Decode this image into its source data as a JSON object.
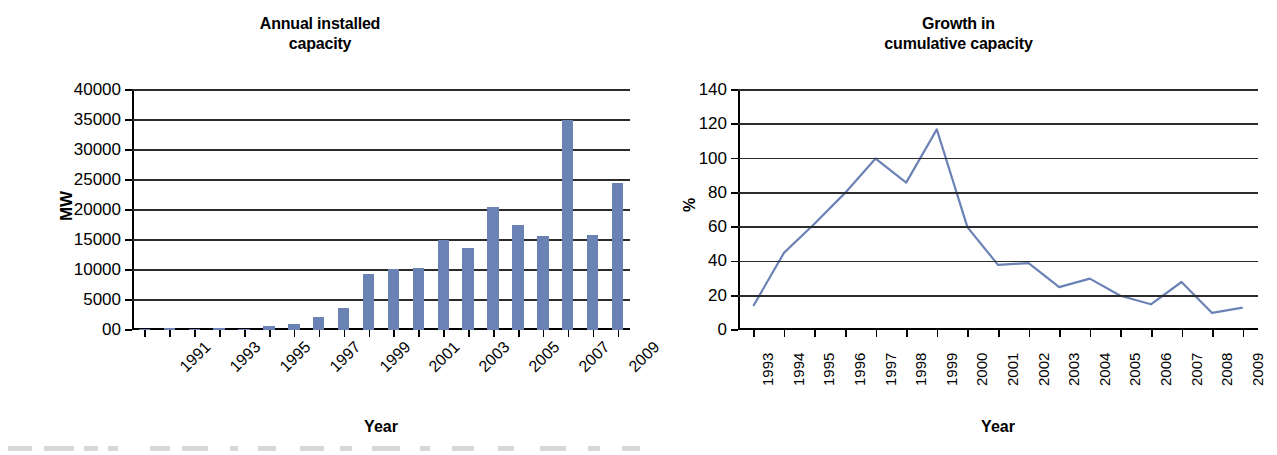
{
  "figure": {
    "background": "#ffffff",
    "series_color": "#6b82b5",
    "axis_color": "#000000"
  },
  "charts": [
    {
      "id": "annual-installed-capacity",
      "title_line1": "Annual installed",
      "title_line2": "capacity",
      "xlabel": "Year",
      "ylabel": "MW"
    },
    {
      "id": "growth-in-cumulative-capacity",
      "title_line1": "Growth in",
      "title_line2": "cumulative capacity",
      "xlabel": "Year",
      "ylabel": "%"
    }
  ],
  "chart_data": [
    {
      "type": "bar",
      "title": "Annual installed capacity",
      "xlabel": "Year",
      "ylabel": "MW",
      "ylim": [
        0,
        40000
      ],
      "ytick_labels": [
        "40000",
        "35000",
        "30000",
        "25000",
        "20000",
        "15000",
        "10000",
        "5000",
        "00"
      ],
      "ytick_values": [
        40000,
        35000,
        30000,
        25000,
        20000,
        15000,
        10000,
        5000,
        0
      ],
      "grid": true,
      "legend": "none",
      "categories": [
        1991,
        1992,
        1993,
        1994,
        1995,
        1996,
        1997,
        1998,
        1999,
        2000,
        2001,
        2002,
        2003,
        2004,
        2005,
        2006,
        2007,
        2008,
        2009
      ],
      "xtick_labels_shown": [
        "1991",
        "1993",
        "1995",
        "1997",
        "1999",
        "2001",
        "2003",
        "2005",
        "2007",
        "2009"
      ],
      "values": [
        200,
        300,
        150,
        350,
        250,
        600,
        1000,
        2250,
        3700,
        9400,
        10100,
        10350,
        15000,
        13700,
        20500,
        17500,
        15600,
        35000,
        15800,
        24500
      ]
    },
    {
      "type": "line",
      "title": "Growth in cumulative capacity",
      "xlabel": "Year",
      "ylabel": "%",
      "ylim": [
        0,
        140
      ],
      "ytick_labels": [
        "0",
        "20",
        "40",
        "60",
        "80",
        "100",
        "120",
        "140"
      ],
      "ytick_values": [
        0,
        20,
        40,
        60,
        80,
        100,
        120,
        140
      ],
      "grid": true,
      "legend": "none",
      "x": [
        1993,
        1994,
        1995,
        1996,
        1997,
        1998,
        1999,
        2000,
        2001,
        2002,
        2003,
        2004,
        2005,
        2006,
        2007,
        2008,
        2009
      ],
      "xtick_labels": [
        "1993",
        "1994",
        "1995",
        "1996",
        "1997",
        "1998",
        "1999",
        "2000",
        "2001",
        "2002",
        "2003",
        "2004",
        "2005",
        "2006",
        "2007",
        "2008",
        "2009"
      ],
      "values": [
        14,
        45,
        62,
        80,
        100,
        86,
        117,
        60,
        38,
        39,
        25,
        30,
        20,
        15,
        28,
        10,
        13
      ]
    }
  ]
}
